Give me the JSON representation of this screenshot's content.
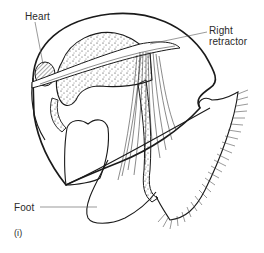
{
  "figure": {
    "panel_id": "(i)",
    "labels": [
      {
        "key": "heart",
        "text": "Heart"
      },
      {
        "key": "right_retractor",
        "text": "Right retractor"
      },
      {
        "key": "foot",
        "text": "Foot"
      }
    ],
    "colors": {
      "line": "#1a1a1a",
      "label_text": "#2a2a2a",
      "leader_line": "#555555",
      "background": "#ffffff"
    }
  }
}
